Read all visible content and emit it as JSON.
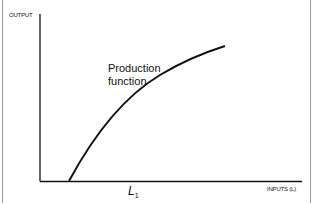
{
  "diagram": {
    "title": "Production function",
    "y_axis_label": "OUTPUT",
    "x_axis_label": "INPUTS (L)",
    "curve_label_line1": "Production",
    "curve_label_line2": "function",
    "x_marker_label": "L",
    "x_marker_subscript": "1",
    "colors": {
      "line": "#111111",
      "border": "#9a9a9a",
      "background": "#ffffff"
    }
  }
}
